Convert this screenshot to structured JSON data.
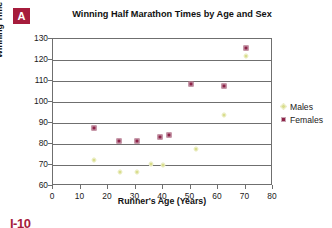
{
  "panel": {
    "letter": "A"
  },
  "page_marker": "I-10",
  "legend": {
    "position": "right",
    "items": [
      {
        "label": "Males",
        "marker": "diamond",
        "color": "#d9dd8c"
      },
      {
        "label": "Females",
        "marker": "square",
        "color": "#8e2348"
      }
    ]
  },
  "chart_data": {
    "type": "scatter",
    "title": "Winning Half Marathon Times by Age and Sex",
    "xlabel": "Runner's Age (Years)",
    "ylabel": "Winning Time (Minutes)",
    "xlim": [
      0,
      80
    ],
    "ylim": [
      60,
      130
    ],
    "xticks": [
      0,
      10,
      20,
      30,
      40,
      50,
      60,
      70,
      80
    ],
    "yticks": [
      60,
      70,
      80,
      90,
      100,
      110,
      120,
      130
    ],
    "grid": "horizontal",
    "series": [
      {
        "name": "Males",
        "color": "#d9dd8c",
        "marker": "diamond",
        "points": [
          {
            "x": 15,
            "y": 72.5
          },
          {
            "x": 24.5,
            "y": 66.5
          },
          {
            "x": 30.5,
            "y": 66.5
          },
          {
            "x": 35.5,
            "y": 70.5
          },
          {
            "x": 40,
            "y": 70
          },
          {
            "x": 52,
            "y": 77.5
          },
          {
            "x": 62,
            "y": 94
          },
          {
            "x": 70,
            "y": 122
          }
        ]
      },
      {
        "name": "Females",
        "color": "#8e2348",
        "marker": "square",
        "points": [
          {
            "x": 15,
            "y": 87.5
          },
          {
            "x": 24,
            "y": 81.5
          },
          {
            "x": 30.5,
            "y": 81.5
          },
          {
            "x": 39,
            "y": 83.5
          },
          {
            "x": 42,
            "y": 84.5
          },
          {
            "x": 50,
            "y": 108.5
          },
          {
            "x": 62,
            "y": 107.5
          },
          {
            "x": 70,
            "y": 125.5
          }
        ]
      }
    ]
  }
}
